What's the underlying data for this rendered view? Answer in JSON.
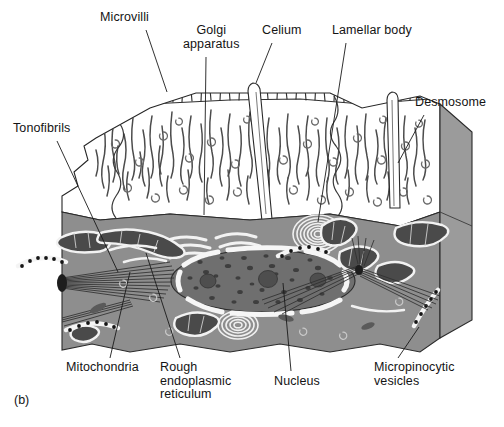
{
  "figure": {
    "panel_mark": "(b)",
    "title_alt": "Ultrastructure of an epithelial cell",
    "colors": {
      "background": "#ffffff",
      "ink": "#1a1a1a",
      "apical_cytoplasm": "#ffffff",
      "basal_cytoplasm": "#8e8e8e",
      "side_face": "#9a9a9a",
      "organelle_dark": "#4a4a4a",
      "organelle_outline": "#ffffff",
      "nucleoplasm": "#7a7a7a",
      "nucleolus": "#5a5a5a",
      "fibril": "#3c3c3c"
    }
  },
  "labels": [
    {
      "id": "microvilli",
      "text": "Microvilli",
      "x": 100,
      "y": 11,
      "align": "left",
      "leader": {
        "x1": 146,
        "y1": 30,
        "x2": 167,
        "y2": 92
      }
    },
    {
      "id": "golgi",
      "text": "Golgi\napparatus",
      "x": 183,
      "y": 24,
      "align": "center",
      "leader": {
        "x1": 206,
        "y1": 57,
        "x2": 204,
        "y2": 215
      }
    },
    {
      "id": "celium",
      "text": "Celium",
      "x": 262,
      "y": 24,
      "align": "left",
      "leader": {
        "x1": 272,
        "y1": 43,
        "x2": 256,
        "y2": 83
      }
    },
    {
      "id": "lamellar-body",
      "text": "Lamellar body",
      "x": 332,
      "y": 24,
      "align": "left",
      "leader": {
        "x1": 346,
        "y1": 43,
        "x2": 318,
        "y2": 222
      }
    },
    {
      "id": "desmosome",
      "text": "Desmosome",
      "x": 415,
      "y": 96,
      "align": "left",
      "leader": {
        "x1": 424,
        "y1": 115,
        "x2": 398,
        "y2": 163
      }
    },
    {
      "id": "tonofibrils",
      "text": "Tonofibrils",
      "x": 13,
      "y": 122,
      "align": "left",
      "leader": {
        "x1": 57,
        "y1": 141,
        "x2": 118,
        "y2": 272
      }
    },
    {
      "id": "mitochondria",
      "text": "Mitochondria",
      "x": 66,
      "y": 361,
      "align": "left",
      "leader": {
        "x1": 110,
        "y1": 358,
        "x2": 130,
        "y2": 272
      }
    },
    {
      "id": "rough-er",
      "text": "Rough\nendoplasmic\nreticulum",
      "x": 160,
      "y": 361,
      "align": "left",
      "leader": {
        "x1": 180,
        "y1": 358,
        "x2": 146,
        "y2": 253
      }
    },
    {
      "id": "nucleus",
      "text": "Nucleus",
      "x": 274,
      "y": 375,
      "align": "left",
      "leader": {
        "x1": 291,
        "y1": 371,
        "x2": 283,
        "y2": 283
      }
    },
    {
      "id": "micropinocytic",
      "text": "Micropinocytic\nvesicles",
      "x": 374,
      "y": 361,
      "align": "left",
      "leader": {
        "x1": 398,
        "y1": 358,
        "x2": 419,
        "y2": 327
      }
    }
  ],
  "structures": [
    {
      "name": "apical-surface",
      "description": "white apical cytoplasm with microvilli along top edge"
    },
    {
      "name": "microvilli",
      "count": 34,
      "description": "short vertical strokes on apical membrane"
    },
    {
      "name": "tonofibril-strands",
      "count": 58,
      "description": "wavy vertical filaments in apical cytoplasm"
    },
    {
      "name": "ribosome-marks",
      "count": 40,
      "description": "small c-shaped marks scattered in cytoplasm"
    },
    {
      "name": "cilium",
      "description": "long tapered shaft rising from apical surface near centre"
    },
    {
      "name": "cilium-right",
      "description": "second tapered cilium shaft on right side"
    },
    {
      "name": "nucleus",
      "description": "large speckled oval with segmented white nuclear envelope",
      "nucleoli": 3
    },
    {
      "name": "lamellar-body",
      "description": "concentric-ring whorl in upper right cytoplasm"
    },
    {
      "name": "lamellar-body-lower",
      "description": "smaller concentric-ring whorl below nucleus"
    },
    {
      "name": "golgi-apparatus",
      "description": "stack of curved white arcs left of centre"
    },
    {
      "name": "mitochondria",
      "count": 8,
      "description": "dark cristate rods with white halo"
    },
    {
      "name": "micropinocytic-vesicles",
      "count": 4,
      "description": "white bands studded with black dots"
    },
    {
      "name": "desmosome-fans",
      "count": 3,
      "description": "converging fans of dark tonofilaments"
    },
    {
      "name": "basal-membrane",
      "description": "wavy lower border of the cell block"
    },
    {
      "name": "block-right-face",
      "description": "three-dimensional cut face on the right"
    }
  ]
}
